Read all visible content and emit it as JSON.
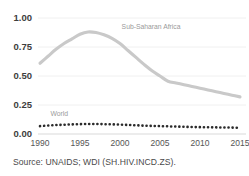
{
  "chart_data": {
    "type": "line",
    "title": "",
    "subtitle": "",
    "xlabel": "",
    "ylabel": "",
    "xlim": [
      1990,
      2015
    ],
    "ylim": [
      0.0,
      1.0
    ],
    "grid": true,
    "legend": "inline-annotations",
    "x": [
      1990,
      1991,
      1992,
      1993,
      1994,
      1995,
      1996,
      1997,
      1998,
      1999,
      2000,
      2001,
      2002,
      2003,
      2004,
      2005,
      2006,
      2007,
      2008,
      2009,
      2010,
      2011,
      2012,
      2013,
      2014,
      2015
    ],
    "xtick_labels": [
      "1990",
      "1995",
      "2000",
      "2005",
      "2010",
      "2015"
    ],
    "xticks": [
      1990,
      1995,
      2000,
      2005,
      2010,
      2015
    ],
    "ytick_labels": [
      "0.00",
      "0.25",
      "0.50",
      "0.75",
      "1.00"
    ],
    "yticks": [
      0.0,
      0.25,
      0.5,
      0.75,
      1.0
    ],
    "series": [
      {
        "name": "Sub-Saharan Africa",
        "style": "solid",
        "color": "#c9c9c9",
        "label_x": 2000.2,
        "label_y": 0.905,
        "values": [
          0.61,
          0.67,
          0.73,
          0.78,
          0.82,
          0.86,
          0.88,
          0.875,
          0.855,
          0.825,
          0.78,
          0.72,
          0.66,
          0.6,
          0.545,
          0.5,
          0.455,
          0.44,
          0.425,
          0.41,
          0.395,
          0.38,
          0.365,
          0.35,
          0.335,
          0.32
        ]
      },
      {
        "name": "World",
        "style": "dotted",
        "color": "#2b2b2b",
        "label_x": 1991.3,
        "label_y": 0.155,
        "values": [
          0.068,
          0.073,
          0.077,
          0.08,
          0.083,
          0.085,
          0.086,
          0.086,
          0.085,
          0.083,
          0.081,
          0.078,
          0.075,
          0.072,
          0.07,
          0.068,
          0.066,
          0.064,
          0.062,
          0.06,
          0.059,
          0.058,
          0.057,
          0.056,
          0.055,
          0.054
        ]
      }
    ],
    "source_note": "Source: UNAIDS; WDI (SH.HIV.INCD.ZS)."
  }
}
